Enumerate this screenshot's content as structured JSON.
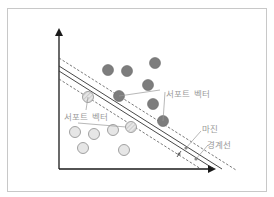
{
  "diagram": {
    "title": "",
    "labels": {
      "support_vector_upper": "서포트 벡터",
      "support_vector_lower": "서포트 벡터",
      "margin": "마진",
      "boundary": "경계선"
    },
    "colors": {
      "frame": "#c8c8c8",
      "axis": "#1a1a1a",
      "class_a_fill": "#7d7d7d",
      "class_a_stroke": "#6a6a6a",
      "class_b_fill": "#e6e6e6",
      "class_b_stroke": "#8c8c8c",
      "line": "#333333",
      "dashed": "#555555",
      "leader": "#9a9a9a",
      "label": "#9a9a9a"
    },
    "class_a_points": [
      {
        "x": 108,
        "y": 70
      },
      {
        "x": 127,
        "y": 71
      },
      {
        "x": 155,
        "y": 63
      },
      {
        "x": 148,
        "y": 85
      },
      {
        "x": 153,
        "y": 104
      },
      {
        "x": 119,
        "y": 96,
        "support": true
      },
      {
        "x": 163,
        "y": 121,
        "support": true
      }
    ],
    "class_b_points": [
      {
        "x": 75,
        "y": 132
      },
      {
        "x": 94,
        "y": 134
      },
      {
        "x": 113,
        "y": 130
      },
      {
        "x": 83,
        "y": 148
      },
      {
        "x": 124,
        "y": 150
      },
      {
        "x": 88,
        "y": 97,
        "support": true
      },
      {
        "x": 131,
        "y": 127,
        "support": true
      }
    ]
  }
}
